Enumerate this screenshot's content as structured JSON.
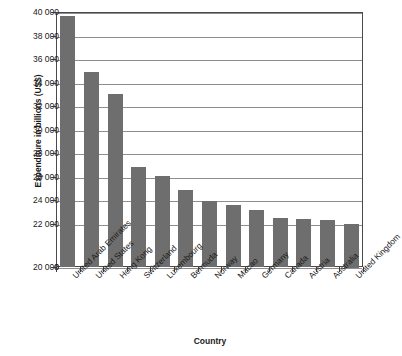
{
  "chart_data": {
    "type": "bar",
    "title": "",
    "subtitle": "",
    "xlabel": "Country",
    "ylabel": "Expenditure in billions (US$)",
    "categories": [
      "United Arab Emirates",
      "United States",
      "Hong Kong",
      "Switzerland",
      "Luxembourg",
      "Bermuda",
      "Norway",
      "Macao",
      "Germany",
      "Canada",
      "Austria",
      "Australia",
      "United Kingdom"
    ],
    "values": [
      39700,
      34900,
      33000,
      26800,
      26050,
      24850,
      23950,
      23600,
      23150,
      22500,
      22350,
      22300,
      22000
    ],
    "ylim": [
      20000,
      40000
    ],
    "y_axis_has_break": true,
    "y_baseline_label": "0",
    "ytick_labels": [
      "40 000",
      "38 000",
      "36 000",
      "34 000",
      "32 000",
      "30 000",
      "28 000",
      "26 000",
      "24 000",
      "22 000",
      "20 000",
      "0"
    ],
    "ytick_values": [
      40000,
      38000,
      36000,
      34000,
      32000,
      30000,
      28000,
      26000,
      24000,
      22000,
      20000,
      0
    ],
    "grid": true,
    "grid_axis": "y",
    "legend": false,
    "legend_position": "none",
    "bar_color": "#6e6e6e",
    "axis_color": "#4a4a4a",
    "gridline_color": "#8e8e8e",
    "background_color": "#ffffff"
  }
}
